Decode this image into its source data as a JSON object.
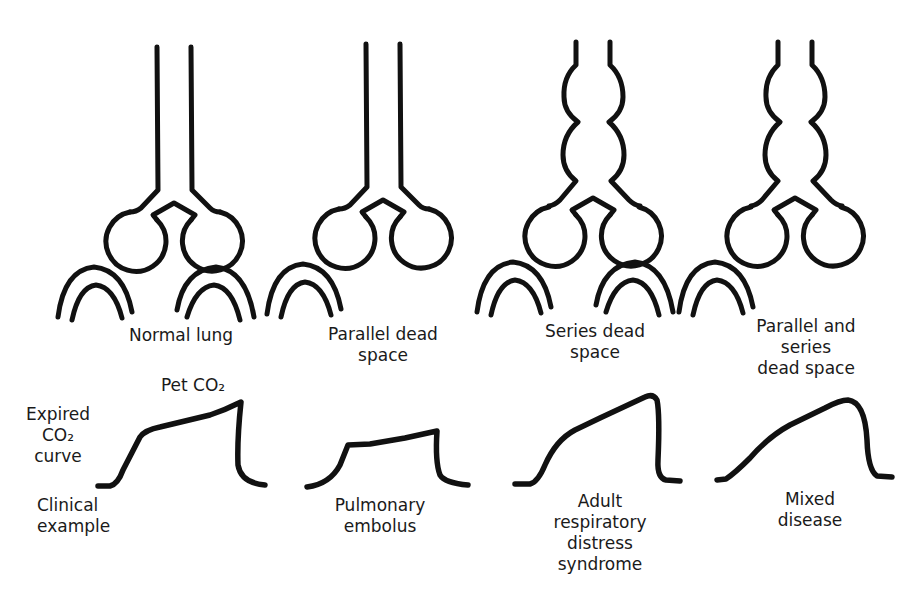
{
  "figure": {
    "row_labels": {
      "expired_curve": [
        "Expired",
        "CO₂",
        "curve"
      ],
      "clinical_example": [
        "Clinical",
        "example"
      ],
      "pet_co2": "Pet CO₂"
    },
    "panels": [
      {
        "id": "normal",
        "title_lines": [
          "Normal lung"
        ],
        "airway": "straight",
        "perfused_alveoli": [
          "left",
          "right"
        ],
        "curve_shape": "plateau-rising",
        "clinical_example_lines": []
      },
      {
        "id": "parallel",
        "title_lines": [
          "Parallel dead",
          "space"
        ],
        "airway": "straight",
        "perfused_alveoli": [
          "left"
        ],
        "curve_shape": "low-plateau",
        "clinical_example_lines": [
          "Pulmonary",
          "embolus"
        ]
      },
      {
        "id": "series",
        "title_lines": [
          "Series dead",
          "space"
        ],
        "airway": "dilated",
        "perfused_alveoli": [
          "left",
          "right"
        ],
        "curve_shape": "sloping",
        "clinical_example_lines": [
          "Adult",
          "respiratory",
          "distress",
          "syndrome"
        ]
      },
      {
        "id": "parallel-series",
        "title_lines": [
          "Parallel and",
          "series",
          "dead space"
        ],
        "airway": "dilated",
        "perfused_alveoli": [
          "left"
        ],
        "curve_shape": "sloping-low",
        "clinical_example_lines": [
          "Mixed",
          "disease"
        ]
      }
    ]
  }
}
